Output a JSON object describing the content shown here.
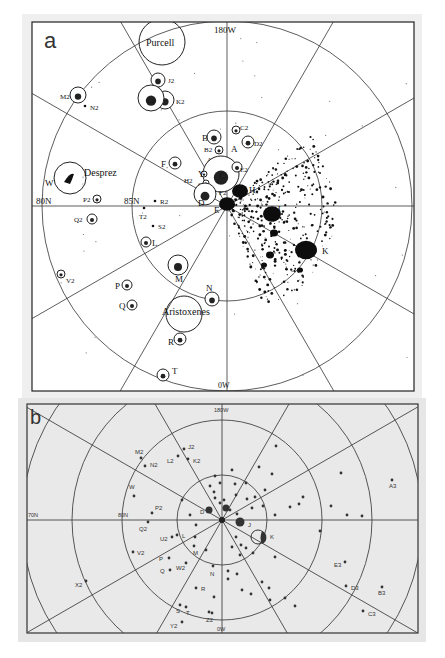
{
  "panel_a": {
    "letter": "a",
    "grid_labels": {
      "top": "180W",
      "bottom": "0W",
      "outer_lat": "80N",
      "inner_lat": "85N"
    },
    "named_craters": [
      {
        "name": "Purcell",
        "x": 162,
        "y": 42,
        "r": 23
      },
      {
        "name": "Desprez",
        "x": 70,
        "y": 178,
        "r": 16
      },
      {
        "name": "Aristoxenes",
        "x": 184,
        "y": 314,
        "r": 18
      }
    ],
    "features": [
      {
        "id": "J2",
        "x": 158,
        "y": 80,
        "r": 7,
        "lx": 168,
        "ly": 83
      },
      {
        "id": "K2",
        "x": 165,
        "y": 100,
        "r": 9,
        "lx": 176,
        "ly": 104
      },
      {
        "id": "L2",
        "x": 151,
        "y": 98,
        "r": 13,
        "lx": 147,
        "ly": 103,
        "inner": true
      },
      {
        "id": "M2",
        "x": 78,
        "y": 95,
        "r": 8,
        "lx": 60,
        "ly": 99
      },
      {
        "id": "N2",
        "x": 85,
        "y": 106,
        "r": 0,
        "lx": 90,
        "ly": 110
      },
      {
        "id": "B",
        "x": 214,
        "y": 137,
        "r": 7,
        "lx": 202,
        "ly": 141
      },
      {
        "id": "C2",
        "x": 236,
        "y": 130,
        "r": 4,
        "lx": 240,
        "ly": 130
      },
      {
        "id": "D2",
        "x": 248,
        "y": 142,
        "r": 6,
        "lx": 254,
        "ly": 146
      },
      {
        "id": "A",
        "x": 219,
        "y": 150,
        "r": 4,
        "lx": 231,
        "ly": 152
      },
      {
        "id": "B2",
        "x": 219,
        "y": 150,
        "r": 0,
        "lx": 204,
        "ly": 152
      },
      {
        "id": "A2",
        "x": 218,
        "y": 160,
        "r": 3,
        "lx": 207,
        "ly": 162
      },
      {
        "id": "C",
        "x": 221,
        "y": 174,
        "r": 18,
        "lx": 219,
        "ly": 179
      },
      {
        "id": "E2",
        "x": 237,
        "y": 167,
        "r": 5,
        "lx": 240,
        "ly": 172
      },
      {
        "id": "F",
        "x": 175,
        "y": 163,
        "r": 6,
        "lx": 161,
        "ly": 167
      },
      {
        "id": "Y",
        "x": 204,
        "y": 174,
        "r": 3,
        "lx": 198,
        "ly": 177
      },
      {
        "id": "H2",
        "x": 199,
        "y": 180,
        "r": 0,
        "lx": 184,
        "ly": 183
      },
      {
        "id": "G2",
        "x": 206,
        "y": 183,
        "r": 3,
        "lx": 198,
        "ly": 187
      },
      {
        "id": "F2",
        "x": 224,
        "y": 192,
        "r": 0,
        "lx": 219,
        "ly": 195
      },
      {
        "id": "H",
        "x": 240,
        "y": 191,
        "r": 0,
        "lx": 249,
        "ly": 193
      },
      {
        "id": "D",
        "x": 205,
        "y": 194,
        "r": 11,
        "lx": 198,
        "ly": 206
      },
      {
        "id": "E",
        "x": 226,
        "y": 205,
        "r": 0,
        "lx": 214,
        "ly": 213
      },
      {
        "id": "J",
        "x": 280,
        "y": 216,
        "r": 0,
        "lx": 277,
        "ly": 212
      },
      {
        "id": "K",
        "x": 306,
        "y": 250,
        "r": 0,
        "lx": 322,
        "ly": 254
      },
      {
        "id": "W",
        "x": 70,
        "y": 178,
        "r": 0,
        "lx": 45,
        "ly": 186
      },
      {
        "id": "P2",
        "x": 97,
        "y": 199,
        "r": 4,
        "lx": 83,
        "ly": 202
      },
      {
        "id": "Q2",
        "x": 92,
        "y": 219,
        "r": 5,
        "lx": 74,
        "ly": 222
      },
      {
        "id": "R2",
        "x": 155,
        "y": 201,
        "r": 0,
        "lx": 160,
        "ly": 204
      },
      {
        "id": "T2",
        "x": 144,
        "y": 208,
        "r": 0,
        "lx": 139,
        "ly": 219
      },
      {
        "id": "S2",
        "x": 153,
        "y": 226,
        "r": 0,
        "lx": 158,
        "ly": 229
      },
      {
        "id": "L",
        "x": 146,
        "y": 242,
        "r": 5,
        "lx": 152,
        "ly": 246
      },
      {
        "id": "M",
        "x": 178,
        "y": 265,
        "r": 10,
        "lx": 175,
        "ly": 282
      },
      {
        "id": "N",
        "x": 212,
        "y": 299,
        "r": 7,
        "lx": 206,
        "ly": 291
      },
      {
        "id": "V2",
        "x": 61,
        "y": 274,
        "r": 4,
        "lx": 66,
        "ly": 283
      },
      {
        "id": "P",
        "x": 127,
        "y": 285,
        "r": 5,
        "lx": 115,
        "ly": 289
      },
      {
        "id": "Q",
        "x": 132,
        "y": 305,
        "r": 5,
        "lx": 119,
        "ly": 309
      },
      {
        "id": "R",
        "x": 180,
        "y": 339,
        "r": 6,
        "lx": 168,
        "ly": 345
      },
      {
        "id": "T",
        "x": 163,
        "y": 375,
        "r": 6,
        "lx": 172,
        "ly": 374
      }
    ]
  },
  "panel_b": {
    "letter": "b",
    "grid_labels": {
      "top": "180W",
      "bottom": "0W",
      "lat_1": "80N",
      "lat_2": "70N"
    },
    "points": [
      {
        "id": "M2",
        "x": 141,
        "y": 458,
        "lx": 135,
        "ly": 454
      },
      {
        "id": "N2",
        "x": 145,
        "y": 466,
        "lx": 150,
        "ly": 467
      },
      {
        "id": "J2",
        "x": 184,
        "y": 449,
        "lx": 188,
        "ly": 449
      },
      {
        "id": "L2",
        "x": 178,
        "y": 456,
        "lx": 167,
        "ly": 463
      },
      {
        "id": "K2",
        "x": 188,
        "y": 459,
        "lx": 193,
        "ly": 463
      },
      {
        "id": "W",
        "x": 134,
        "y": 496,
        "lx": 129,
        "ly": 489
      },
      {
        "id": "P2",
        "x": 152,
        "y": 513,
        "lx": 155,
        "ly": 510
      },
      {
        "id": "Q2",
        "x": 148,
        "y": 522,
        "lx": 139,
        "ly": 531
      },
      {
        "id": "D",
        "x": 209,
        "y": 510,
        "lx": 200,
        "ly": 514
      },
      {
        "id": "J",
        "x": 240,
        "y": 522,
        "lx": 248,
        "ly": 527
      },
      {
        "id": "K",
        "x": 262,
        "y": 537,
        "lx": 270,
        "ly": 539
      },
      {
        "id": "U2",
        "x": 172,
        "y": 537,
        "lx": 160,
        "ly": 541
      },
      {
        "id": "L",
        "x": 177,
        "y": 535,
        "lx": 182,
        "ly": 538
      },
      {
        "id": "V2",
        "x": 133,
        "y": 552,
        "lx": 137,
        "ly": 555
      },
      {
        "id": "M",
        "x": 194,
        "y": 546,
        "lx": 193,
        "ly": 555
      },
      {
        "id": "P",
        "x": 169,
        "y": 558,
        "lx": 159,
        "ly": 561
      },
      {
        "id": "W2",
        "x": 186,
        "y": 563,
        "lx": 176,
        "ly": 570
      },
      {
        "id": "Q",
        "x": 170,
        "y": 570,
        "lx": 160,
        "ly": 573
      },
      {
        "id": "N",
        "x": 213,
        "y": 566,
        "lx": 210,
        "ly": 576
      },
      {
        "id": "R",
        "x": 196,
        "y": 588,
        "lx": 201,
        "ly": 591
      },
      {
        "id": "X2",
        "x": 86,
        "y": 581,
        "lx": 75,
        "ly": 587
      },
      {
        "id": "S",
        "x": 180,
        "y": 605,
        "lx": 176,
        "ly": 613
      },
      {
        "id": "T",
        "x": 186,
        "y": 607,
        "lx": 186,
        "ly": 615
      },
      {
        "id": "Z2",
        "x": 212,
        "y": 613,
        "lx": 206,
        "ly": 622
      },
      {
        "id": "Y2",
        "x": 182,
        "y": 622,
        "lx": 170,
        "ly": 628
      },
      {
        "id": "A3",
        "x": 392,
        "y": 480,
        "lx": 389,
        "ly": 488
      },
      {
        "id": "E3",
        "x": 345,
        "y": 562,
        "lx": 334,
        "ly": 567
      },
      {
        "id": "D3",
        "x": 346,
        "y": 586,
        "lx": 351,
        "ly": 590
      },
      {
        "id": "B3",
        "x": 382,
        "y": 587,
        "lx": 378,
        "ly": 595
      },
      {
        "id": "C3",
        "x": 363,
        "y": 611,
        "lx": 368,
        "ly": 616
      }
    ],
    "unlabeled_points": [
      [
        215,
        476
      ],
      [
        232,
        470
      ],
      [
        210,
        486
      ],
      [
        220,
        483
      ],
      [
        235,
        484
      ],
      [
        246,
        483
      ],
      [
        214,
        492
      ],
      [
        215,
        498
      ],
      [
        224,
        500
      ],
      [
        236,
        495
      ],
      [
        247,
        499
      ],
      [
        220,
        503
      ],
      [
        230,
        510
      ],
      [
        237,
        514
      ],
      [
        255,
        497
      ],
      [
        272,
        474
      ],
      [
        276,
        446
      ],
      [
        252,
        508
      ],
      [
        263,
        506
      ],
      [
        275,
        515
      ],
      [
        290,
        507
      ],
      [
        299,
        504
      ],
      [
        303,
        497
      ],
      [
        341,
        473
      ],
      [
        331,
        506
      ],
      [
        347,
        515
      ],
      [
        259,
        467
      ],
      [
        265,
        490
      ],
      [
        196,
        525
      ],
      [
        195,
        537
      ],
      [
        182,
        500
      ],
      [
        190,
        515
      ],
      [
        236,
        537
      ],
      [
        241,
        545
      ],
      [
        246,
        548
      ],
      [
        253,
        553
      ],
      [
        240,
        555
      ],
      [
        232,
        547
      ],
      [
        206,
        550
      ],
      [
        228,
        571
      ],
      [
        228,
        579
      ],
      [
        237,
        574
      ],
      [
        242,
        590
      ],
      [
        251,
        594
      ],
      [
        262,
        582
      ],
      [
        269,
        588
      ],
      [
        275,
        557
      ],
      [
        270,
        600
      ],
      [
        295,
        606
      ],
      [
        285,
        598
      ],
      [
        214,
        597
      ],
      [
        209,
        612
      ],
      [
        320,
        531
      ],
      [
        362,
        516
      ]
    ]
  }
}
